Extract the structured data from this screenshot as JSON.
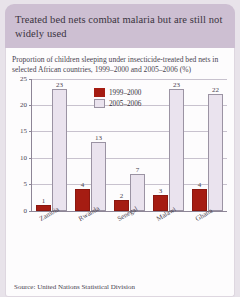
{
  "header": {
    "title": "Treated bed nets combat malaria but are still not widely used"
  },
  "card": {
    "subtitle": "Proportion of children sleeping under insecticide-treated bed nets in selected African countries, 1999–2000 and 2005–2006 (%)",
    "source": "Source: United Nations Statistical Division"
  },
  "colors": {
    "series_1999_2000": "#a51c12",
    "series_2005_2006": "#eae3ee",
    "header_band": "#cdbfd2",
    "page_background": "#e8e3ea",
    "card_background": "#fdfcfd",
    "gridline": "#c8c2ce",
    "axis": "#8d8596"
  },
  "chart_data": {
    "type": "bar",
    "title": "Proportion of children sleeping under insecticide-treated bed nets in selected African countries, 1999–2000 and 2005–2006 (%)",
    "xlabel": "",
    "ylabel": "",
    "ylim": [
      0,
      25
    ],
    "yticks": [
      0,
      5,
      10,
      15,
      20,
      25
    ],
    "grid": true,
    "legend_position": "top-center",
    "categories": [
      "Zambia",
      "Rwanda",
      "Senegal",
      "Malawi",
      "Ghana"
    ],
    "series": [
      {
        "name": "1999–2000",
        "color": "#a51c12",
        "values": [
          1,
          4,
          2,
          3,
          4
        ]
      },
      {
        "name": "2005–2006",
        "color": "#eae3ee",
        "values": [
          23,
          13,
          7,
          23,
          22
        ]
      }
    ]
  }
}
